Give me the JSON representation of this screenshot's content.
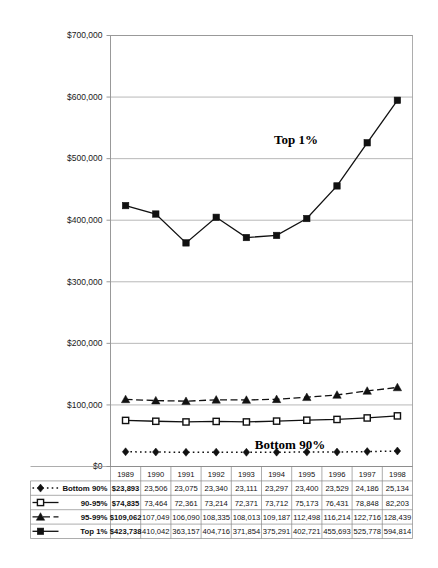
{
  "chart_data": {
    "type": "line",
    "title": "",
    "subtitle": "",
    "xlabel": "",
    "ylabel": "",
    "grid": true,
    "legend_position": "table-left",
    "categories": [
      "1989",
      "1990",
      "1991",
      "1992",
      "1993",
      "1994",
      "1995",
      "1996",
      "1997",
      "1998"
    ],
    "ylim": [
      0,
      700000
    ],
    "yticks": [
      0,
      100000,
      200000,
      300000,
      400000,
      500000,
      600000,
      700000
    ],
    "ytick_labels": [
      "$0",
      "$100,000",
      "$200,000",
      "$300,000",
      "$400,000",
      "$500,000",
      "$600,000",
      "$700,000"
    ],
    "series": [
      {
        "name": "Bottom 90%",
        "marker": "diamond",
        "line_style": "dotted",
        "values": [
          23893,
          23506,
          23075,
          23340,
          23111,
          23297,
          23400,
          23529,
          24186,
          25134
        ],
        "value_labels": [
          "$23,893",
          "23,506",
          "23,075",
          "23,340",
          "23,111",
          "23,297",
          "23,400",
          "23,529",
          "24,186",
          "25,134"
        ]
      },
      {
        "name": "90-95%",
        "marker": "square-open",
        "line_style": "solid",
        "values": [
          74835,
          73464,
          72361,
          73214,
          72371,
          73712,
          75173,
          76431,
          78848,
          82203
        ],
        "value_labels": [
          "$74,835",
          "73,464",
          "72,361",
          "73,214",
          "72,371",
          "73,712",
          "75,173",
          "76,431",
          "78,848",
          "82,203"
        ]
      },
      {
        "name": "95-99%",
        "marker": "triangle",
        "line_style": "dashed",
        "values": [
          109062,
          107049,
          106090,
          108335,
          108013,
          109187,
          112498,
          116214,
          122716,
          128439
        ],
        "value_labels": [
          "$109,062",
          "107,049",
          "106,090",
          "108,335",
          "108,013",
          "109,187",
          "112,498",
          "116,214",
          "122,716",
          "128,439"
        ]
      },
      {
        "name": "Top 1%",
        "marker": "square-filled",
        "line_style": "solid",
        "values": [
          423738,
          410042,
          363157,
          404716,
          371854,
          375291,
          402721,
          455693,
          525778,
          594814
        ],
        "value_labels": [
          "$423,738",
          "410,042",
          "363,157",
          "404,716",
          "371,854",
          "375,291",
          "402,721",
          "455,693",
          "525,778",
          "594,814"
        ]
      }
    ],
    "annotations": [
      {
        "text": "Top 1%",
        "x": 296,
        "y": 144
      },
      {
        "text": "Bottom 90%",
        "x": 290,
        "y": 449
      }
    ]
  },
  "data_table": {
    "corner_label": "",
    "header_row": [
      "1989",
      "1990",
      "1991",
      "1992",
      "1993",
      "1994",
      "1995",
      "1996",
      "1997",
      "1998"
    ],
    "rows": [
      {
        "label": "Bottom 90%",
        "marker": "diamond",
        "line_style": "dotted",
        "cells": [
          "$23,893",
          "23,506",
          "23,075",
          "23,340",
          "23,111",
          "23,297",
          "23,400",
          "23,529",
          "24,186",
          "25,134"
        ]
      },
      {
        "label": "90-95%",
        "marker": "square-open",
        "line_style": "solid",
        "cells": [
          "$74,835",
          "73,464",
          "72,361",
          "73,214",
          "72,371",
          "73,712",
          "75,173",
          "76,431",
          "78,848",
          "82,203"
        ]
      },
      {
        "label": "95-99%",
        "marker": "triangle",
        "line_style": "dashed",
        "cells": [
          "$109,062",
          "107,049",
          "106,090",
          "108,335",
          "108,013",
          "109,187",
          "112,498",
          "116,214",
          "122,716",
          "128,439"
        ]
      },
      {
        "label": "Top 1%",
        "marker": "square-filled",
        "line_style": "solid",
        "cells": [
          "$423,738",
          "410,042",
          "363,157",
          "404,716",
          "371,854",
          "375,291",
          "402,721",
          "455,693",
          "525,778",
          "594,814"
        ]
      }
    ]
  },
  "colors": {
    "background": "#ffffff",
    "ink": "#111111",
    "gridline": "#9a9a9a",
    "table_border": "#8a8a8a"
  }
}
